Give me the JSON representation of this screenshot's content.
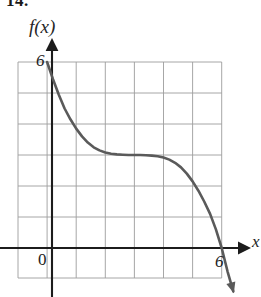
{
  "figure": {
    "problem_number": "14.",
    "function_label": "f(x)",
    "x_axis_label": "x"
  },
  "labels": {
    "y_intercept": "6",
    "origin": "0",
    "x_intercept": "6"
  },
  "colors": {
    "curve": "#5a5a5a",
    "axis": "#1c1c1c",
    "grid": "#8c8c8c",
    "background": "#ffffff"
  },
  "chart_data": {
    "type": "line",
    "title": "",
    "xlabel": "x",
    "ylabel": "f(x)",
    "xlim": [
      -1,
      7
    ],
    "ylim": [
      -1,
      7
    ],
    "grid": true,
    "legend": "none",
    "annotations": [
      "y-intercept at (0, 6)",
      "x-intercept at (6, 0)",
      "inflection plateau near y = 3 between x = 2 and x = 4"
    ],
    "xticks": [
      0,
      6
    ],
    "yticks": [
      6
    ],
    "series": [
      {
        "name": "f(x)",
        "x": [
          0.0,
          0.2,
          0.4,
          0.6,
          0.8,
          1.0,
          1.2,
          1.4,
          1.6,
          1.8,
          2.0,
          2.2,
          2.4,
          2.6,
          2.8,
          3.0,
          3.2,
          3.4,
          3.6,
          3.8,
          4.0,
          4.2,
          4.4,
          4.6,
          4.8,
          5.0,
          5.2,
          5.4,
          5.6,
          5.8,
          6.0,
          6.2,
          6.4
        ],
        "y": [
          6.0,
          5.45,
          4.95,
          4.5,
          4.15,
          3.85,
          3.6,
          3.4,
          3.25,
          3.15,
          3.08,
          3.04,
          3.02,
          3.01,
          3.0,
          3.0,
          3.0,
          2.99,
          2.98,
          2.96,
          2.92,
          2.85,
          2.75,
          2.6,
          2.4,
          2.15,
          1.85,
          1.5,
          1.1,
          0.6,
          0.0,
          -0.75,
          -1.4
        ]
      }
    ]
  }
}
